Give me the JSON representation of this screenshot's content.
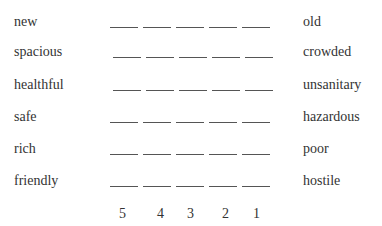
{
  "scale": {
    "rows": [
      {
        "left": "new",
        "right": "old"
      },
      {
        "left": "spacious",
        "right": "crowded"
      },
      {
        "left": "healthful",
        "right": "unsanitary"
      },
      {
        "left": "safe",
        "right": "hazardous"
      },
      {
        "left": "rich",
        "right": "poor"
      },
      {
        "left": "friendly",
        "right": "hostile"
      }
    ],
    "numbers": [
      "5",
      "4",
      "3",
      "2",
      "1"
    ]
  }
}
